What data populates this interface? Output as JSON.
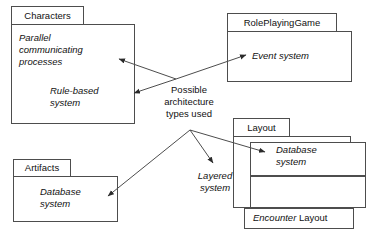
{
  "diagram": {
    "type": "uml-package-diagram",
    "title_note": "Possible architecture types used",
    "background_color": "#ffffff",
    "line_color": "#4d4d4d",
    "text_color": "#111111"
  },
  "packages": [
    {
      "id": "characters",
      "name": "Characters",
      "elements": [
        {
          "id": "parallel-communicating-processes",
          "label": "Parallel\ncommunicating\nprocesses"
        },
        {
          "id": "rule-based-system",
          "label": "Rule-based\nsystem"
        }
      ]
    },
    {
      "id": "roleplayinggame",
      "name": "RolePlayingGame",
      "elements": [
        {
          "id": "event-system",
          "label": "Event system"
        }
      ]
    },
    {
      "id": "artifacts",
      "name": "Artifacts",
      "elements": [
        {
          "id": "artifacts-database-system",
          "label": "Database\nsystem"
        }
      ]
    },
    {
      "id": "layout",
      "name": "Layout",
      "elements": [
        {
          "id": "layout-database-system",
          "label": "Database\nsystem"
        },
        {
          "id": "layered-system",
          "label": "Layered\nsystem"
        }
      ]
    }
  ],
  "boxes": [
    {
      "id": "encounter-layout",
      "italic_part": "Encounter",
      "regular_part": " Layout"
    }
  ],
  "note": {
    "id": "architecture-note",
    "text": "Possible\narchitecture\ntypes used"
  },
  "connections": [
    {
      "from": "architecture-note",
      "to": "parallel-communicating-processes"
    },
    {
      "from": "architecture-note",
      "to": "rule-based-system"
    },
    {
      "from": "architecture-note",
      "to": "event-system"
    },
    {
      "from": "architecture-note",
      "to": "artifacts-database-system"
    },
    {
      "from": "architecture-note",
      "to": "layered-system"
    },
    {
      "from": "architecture-note",
      "to": "layout-database-system"
    }
  ]
}
